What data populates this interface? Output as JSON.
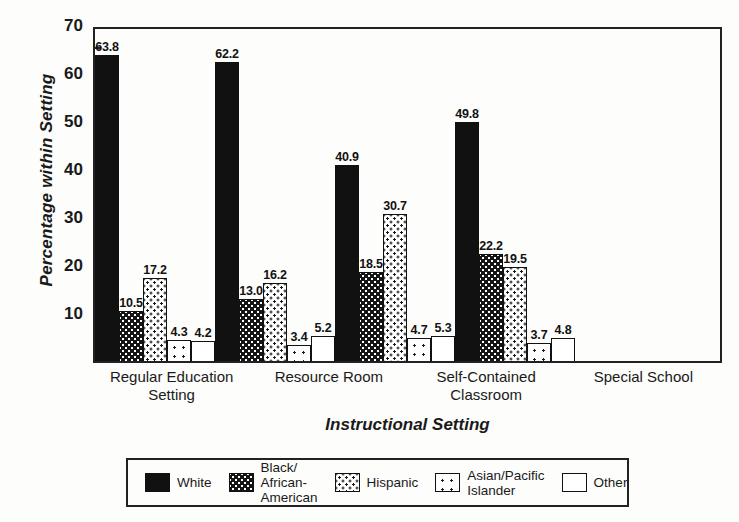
{
  "chart_data": {
    "type": "bar",
    "title": "",
    "xlabel": "Instructional Setting",
    "ylabel": "Percentage within Setting",
    "ylim": [
      0,
      70
    ],
    "yticks": [
      0,
      10,
      20,
      30,
      40,
      50,
      60,
      70
    ],
    "ytick_labels": [
      "",
      "10",
      "20",
      "30",
      "40",
      "50",
      "60",
      "70"
    ],
    "minor_tick_step": 5,
    "grid": false,
    "legend_position": "bottom",
    "categories": [
      "Regular Education Setting",
      "Resource Room",
      "Self-Contained Classroom",
      "Special School"
    ],
    "series": [
      {
        "name": "White",
        "pattern": "solid",
        "values": [
          63.8,
          62.2,
          40.9,
          49.8
        ]
      },
      {
        "name": "Black/African-American",
        "pattern": "check",
        "values": [
          10.5,
          13.0,
          18.5,
          22.2
        ]
      },
      {
        "name": "Hispanic",
        "pattern": "dot",
        "values": [
          17.2,
          16.2,
          30.7,
          19.5
        ]
      },
      {
        "name": "Asian/Pacific Islander",
        "pattern": "sparse",
        "values": [
          4.3,
          3.4,
          4.7,
          3.7
        ]
      },
      {
        "name": "Other",
        "pattern": "empty",
        "values": [
          4.2,
          5.2,
          5.3,
          4.8
        ]
      }
    ]
  },
  "axis": {
    "y_title": "Percentage within Setting",
    "x_title": "Instructional Setting",
    "y_ticks": [
      "70",
      "60",
      "50",
      "40",
      "30",
      "20",
      "10"
    ],
    "x_categories": [
      "Regular Education\nSetting",
      "Resource Room",
      "Self-Contained\nClassroom",
      "Special School"
    ]
  },
  "legend": {
    "entries": [
      {
        "label": "White"
      },
      {
        "label": "Black/\nAfrican-American"
      },
      {
        "label": "Hispanic"
      },
      {
        "label": "Asian/Pacific\nIslander"
      },
      {
        "label": "Other"
      }
    ]
  },
  "colors": {
    "ink": "#111111",
    "paper": "#fdfdfb"
  }
}
